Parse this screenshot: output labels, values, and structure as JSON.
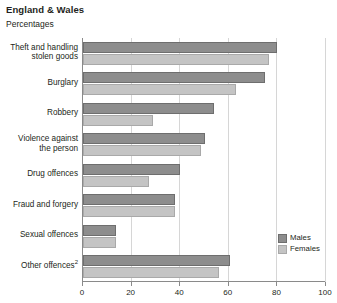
{
  "header": {
    "title": "England & Wales",
    "subtitle": "Percentages"
  },
  "legend": {
    "position": "bottom-right",
    "items": [
      {
        "label": "Males",
        "color": "#8d8d8d"
      },
      {
        "label": "Females",
        "color": "#c4c4c4"
      }
    ]
  },
  "axis": {
    "x_ticks": [
      "0",
      "20",
      "40",
      "60",
      "80",
      "100"
    ]
  },
  "chart_data": {
    "type": "bar",
    "orientation": "horizontal",
    "title": "England & Wales",
    "subtitle": "Percentages",
    "xlabel": "",
    "ylabel": "",
    "xlim": [
      0,
      100
    ],
    "xticks": [
      0,
      20,
      40,
      60,
      80,
      100
    ],
    "grid": true,
    "legend_position": "bottom-right",
    "categories": [
      "Theft and handling stolen goods",
      "Burglary",
      "Robbery",
      "Violence against the person",
      "Drug offences",
      "Fraud and forgery",
      "Sexual offences",
      "Other offences"
    ],
    "category_lines": [
      [
        "Theft and handling",
        "stolen goods"
      ],
      [
        "Burglary"
      ],
      [
        "Robbery"
      ],
      [
        "Violence against",
        "the person"
      ],
      [
        "Drug offences"
      ],
      [
        "Fraud and forgery"
      ],
      [
        "Sexual offences"
      ],
      [
        "Other offences",
        "2"
      ]
    ],
    "series": [
      {
        "name": "Males",
        "color": "#8d8d8d",
        "values": [
          80,
          75,
          54,
          50,
          40,
          38,
          13.5,
          60.5
        ]
      },
      {
        "name": "Females",
        "color": "#c4c4c4",
        "values": [
          76.5,
          63,
          29,
          48.5,
          27,
          38,
          13.5,
          56
        ]
      }
    ]
  }
}
